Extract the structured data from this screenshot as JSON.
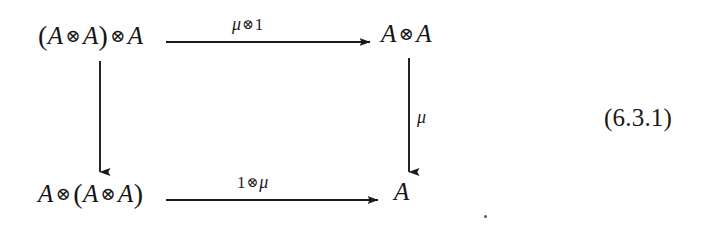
{
  "page": {
    "kind": "commutative-diagram",
    "background_color": "#ffffff",
    "ink_color": "#161616",
    "width": 717,
    "height": 228
  },
  "diagram": {
    "nodes": {
      "top_left": {
        "text": "(A⊗A)⊗A",
        "parts": {
          "open": "(",
          "a1": "A",
          "tensor1": "⊗",
          "a2": "A",
          "close": ")",
          "tensor2": "⊗",
          "a3": "A"
        }
      },
      "top_right": {
        "text": "A⊗A",
        "parts": {
          "a1": "A",
          "tensor1": "⊗",
          "a2": "A"
        }
      },
      "bottom_left": {
        "text": "A⊗(A⊗A)",
        "parts": {
          "a1": "A",
          "tensor1": "⊗",
          "open": "(",
          "a2": "A",
          "tensor2": "⊗",
          "a3": "A",
          "close": ")"
        }
      },
      "bottom_right": {
        "text": "A",
        "parts": {
          "a1": "A"
        }
      }
    },
    "arrows": {
      "top": {
        "from": "top_left",
        "to": "top_right",
        "direction": "right",
        "label": "μ⊗1",
        "label_parts": {
          "mu": "μ",
          "tensor": "⊗",
          "one": "1"
        }
      },
      "bottom": {
        "from": "bottom_left",
        "to": "bottom_right",
        "direction": "right",
        "label": "1⊗μ",
        "label_parts": {
          "one": "1",
          "tensor": "⊗",
          "mu": "μ"
        }
      },
      "left": {
        "from": "top_left",
        "to": "bottom_left",
        "direction": "down",
        "label": ""
      },
      "right": {
        "from": "top_right",
        "to": "bottom_right",
        "direction": "down",
        "label": "μ",
        "label_parts": {
          "mu": "μ"
        }
      }
    }
  },
  "equation_number": "(6.3.1)"
}
